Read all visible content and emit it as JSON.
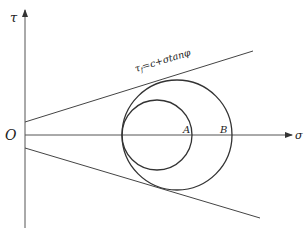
{
  "diagram": {
    "axes": {
      "x_label": "σ",
      "y_label": "τ",
      "origin_label": "O"
    },
    "envelope_label": {
      "tau": "τ",
      "sub": "f",
      "rest": "=c+σtanφ"
    },
    "points": {
      "A": "A",
      "B": "B"
    },
    "circles": [
      {
        "name": "inner-mohr-circle",
        "cx": 157,
        "cy": 135,
        "r": 35
      },
      {
        "name": "outer-mohr-circle",
        "cx": 177,
        "cy": 135,
        "r": 55
      }
    ],
    "colors": {
      "line": "#333333",
      "axis": "#555555"
    }
  }
}
